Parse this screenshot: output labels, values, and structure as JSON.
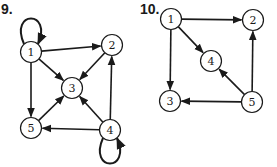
{
  "diagrams": [
    {
      "label": "9.",
      "nodes": [
        {
          "id": "1",
          "x": 31,
          "y": 52
        },
        {
          "id": "2",
          "x": 112,
          "y": 45
        },
        {
          "id": "3",
          "x": 72,
          "y": 88
        },
        {
          "id": "4",
          "x": 110,
          "y": 130
        },
        {
          "id": "5",
          "x": 31,
          "y": 128
        }
      ],
      "edges": [
        {
          "from": "1",
          "to": "1",
          "type": "loop"
        },
        {
          "from": "1",
          "to": "2"
        },
        {
          "from": "1",
          "to": "3"
        },
        {
          "from": "1",
          "to": "5"
        },
        {
          "from": "2",
          "to": "3"
        },
        {
          "from": "5",
          "to": "3"
        },
        {
          "from": "4",
          "to": "3"
        },
        {
          "from": "4",
          "to": "2"
        },
        {
          "from": "4",
          "to": "5"
        },
        {
          "from": "4",
          "to": "4",
          "type": "loop"
        }
      ]
    },
    {
      "label": "10.",
      "nodes": [
        {
          "id": "1",
          "x": 171,
          "y": 19
        },
        {
          "id": "2",
          "x": 253,
          "y": 20
        },
        {
          "id": "4",
          "x": 211,
          "y": 61
        },
        {
          "id": "3",
          "x": 170,
          "y": 101
        },
        {
          "id": "5",
          "x": 252,
          "y": 102
        }
      ],
      "edges": [
        {
          "from": "1",
          "to": "2"
        },
        {
          "from": "1",
          "to": "4"
        },
        {
          "from": "1",
          "to": "3"
        },
        {
          "from": "5",
          "to": "2"
        },
        {
          "from": "5",
          "to": "4"
        },
        {
          "from": "5",
          "to": "3"
        }
      ]
    }
  ]
}
